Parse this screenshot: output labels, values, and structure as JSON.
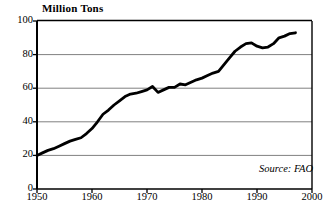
{
  "chart_data": {
    "type": "line",
    "title": "Million Tons",
    "xlabel": "",
    "ylabel": "Million Tons",
    "xlim": [
      1950,
      2000
    ],
    "ylim": [
      0,
      100
    ],
    "xticks": [
      1950,
      1960,
      1970,
      1980,
      1990,
      2000
    ],
    "yticks": [
      0,
      20,
      40,
      60,
      80,
      100
    ],
    "grid": "horizontal",
    "legend": "none",
    "annotations": [
      {
        "text": "Source: FAO",
        "position": "bottom-right"
      }
    ],
    "series": [
      {
        "name": "World Fish Catch",
        "x": [
          1950,
          1951,
          1952,
          1953,
          1954,
          1955,
          1956,
          1957,
          1958,
          1959,
          1960,
          1961,
          1962,
          1963,
          1964,
          1965,
          1966,
          1967,
          1968,
          1969,
          1970,
          1971,
          1972,
          1973,
          1974,
          1975,
          1976,
          1977,
          1978,
          1979,
          1980,
          1981,
          1982,
          1983,
          1984,
          1985,
          1986,
          1987,
          1988,
          1989,
          1990,
          1991,
          1992,
          1993,
          1994,
          1995,
          1996,
          1997
        ],
        "values": [
          20,
          21.5,
          23,
          24,
          25.5,
          27,
          28.5,
          29.5,
          30.5,
          33,
          36,
          40,
          44.5,
          47,
          50,
          52.5,
          55,
          56.5,
          57,
          58,
          59,
          61,
          57.5,
          59,
          60.5,
          60.5,
          62.5,
          62,
          63.5,
          65,
          66,
          67.5,
          69,
          70,
          74,
          78,
          82,
          84.5,
          86.5,
          87,
          85,
          84,
          84.5,
          86.5,
          90,
          91,
          92.5,
          93
        ]
      }
    ]
  },
  "axis": {
    "y_labels": [
      "100",
      "80",
      "60",
      "40",
      "20",
      "0"
    ],
    "x_labels": [
      "1950",
      "1960",
      "1970",
      "1980",
      "1990",
      "2000"
    ]
  },
  "title": {
    "text": "Million Tons"
  },
  "source": {
    "text": "Source: FAO"
  },
  "colors": {
    "line": "#000000",
    "grid": "#808080",
    "axis": "#000000",
    "background": "#ffffff"
  }
}
